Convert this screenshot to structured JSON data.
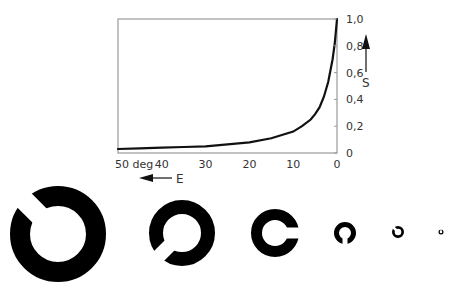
{
  "chart_data": {
    "type": "line",
    "title": "",
    "xlabel": "E",
    "ylabel": "S",
    "x_unit": "deg",
    "xlim": [
      50,
      0
    ],
    "ylim": [
      0,
      1.0
    ],
    "x_reversed": true,
    "y_axis_position": "right",
    "grid": false,
    "x_ticks": [
      "50 deg",
      "40",
      "30",
      "20",
      "10",
      "0"
    ],
    "y_ticks": [
      "0",
      "0,2",
      "0,4",
      "0,6",
      "0,8",
      "1,0"
    ],
    "series": [
      {
        "name": "S(E)",
        "x": [
          50,
          45,
          40,
          35,
          30,
          25,
          20,
          15,
          10,
          8,
          6,
          5,
          4,
          3,
          2,
          1,
          0.5,
          0
        ],
        "y": [
          0.03,
          0.035,
          0.04,
          0.045,
          0.05,
          0.065,
          0.08,
          0.11,
          0.16,
          0.2,
          0.25,
          0.29,
          0.34,
          0.42,
          0.53,
          0.7,
          0.82,
          1.0
        ]
      }
    ],
    "annotations": [
      "arrow pointing left labeled E",
      "arrow pointing up labeled S"
    ]
  },
  "axes": {
    "x_label": "E",
    "y_label": "S",
    "x_ticks": [
      "50 deg",
      "40",
      "30",
      "20",
      "10",
      "0"
    ],
    "y_ticks": [
      "1,0",
      "0,8",
      "0,6",
      "0,4",
      "0,2",
      "0"
    ]
  },
  "landolt_rings": [
    {
      "cx": 58,
      "cy": 234,
      "r_outer": 48,
      "r_inner": 28,
      "gap_direction": "upper-left"
    },
    {
      "cx": 182,
      "cy": 233,
      "r_outer": 33,
      "r_inner": 19,
      "gap_direction": "lower-left"
    },
    {
      "cx": 275,
      "cy": 233,
      "r_outer": 24,
      "r_inner": 13,
      "gap_direction": "right"
    },
    {
      "cx": 345,
      "cy": 233,
      "r_outer": 11,
      "r_inner": 6,
      "gap_direction": "down"
    },
    {
      "cx": 398,
      "cy": 232,
      "r_outer": 6,
      "r_inner": 3.3,
      "gap_direction": "upper-left"
    },
    {
      "cx": 441,
      "cy": 232,
      "r_outer": 2.5,
      "r_inner": 1.3,
      "gap_direction": "up"
    }
  ]
}
